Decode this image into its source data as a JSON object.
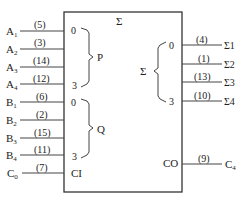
{
  "block": {
    "title": "Σ",
    "input_groups": [
      {
        "label": "P",
        "start_index": "0",
        "end_index": "3"
      },
      {
        "label": "Q",
        "start_index": "0",
        "end_index": "3"
      }
    ],
    "carry_in_label": "CI",
    "output_group": {
      "label": "Σ",
      "start_index": "0",
      "end_index": "3"
    },
    "carry_out_label": "CO"
  },
  "inputs": [
    {
      "name": "A",
      "sub": "1",
      "pin": "(5)"
    },
    {
      "name": "A",
      "sub": "2",
      "pin": "(3)"
    },
    {
      "name": "A",
      "sub": "3",
      "pin": "(14)"
    },
    {
      "name": "A",
      "sub": "4",
      "pin": "(12)"
    },
    {
      "name": "B",
      "sub": "1",
      "pin": "(6)"
    },
    {
      "name": "B",
      "sub": "2",
      "pin": "(2)"
    },
    {
      "name": "B",
      "sub": "3",
      "pin": "(15)"
    },
    {
      "name": "B",
      "sub": "4",
      "pin": "(11)"
    },
    {
      "name": "C",
      "sub": "0",
      "pin": "(7)"
    }
  ],
  "outputs": [
    {
      "name": "Σ1",
      "pin": "(4)"
    },
    {
      "name": "Σ2",
      "pin": "(1)"
    },
    {
      "name": "Σ3",
      "pin": "(13)"
    },
    {
      "name": "Σ4",
      "pin": "(10)"
    },
    {
      "name": "C",
      "sub": "4",
      "pin": "(9)"
    }
  ]
}
